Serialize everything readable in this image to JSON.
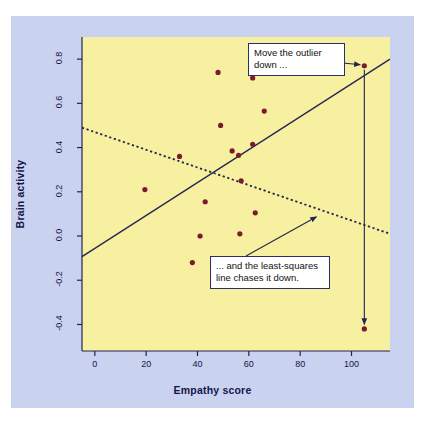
{
  "figure": {
    "background_color": "#ffffff",
    "panel_color": "#c9d2ef",
    "plot_background_color": "#f7f0a0",
    "point_color": "#7b1a2e",
    "line_color": "#23254f",
    "callout_border_color": "#2b2f6b"
  },
  "chart_data": {
    "type": "scatter",
    "title": "",
    "xlabel": "Empathy score",
    "ylabel": "Brain activity",
    "xlim": [
      -5,
      115
    ],
    "ylim": [
      -0.52,
      0.9
    ],
    "xticks": [
      0,
      20,
      40,
      60,
      80,
      100
    ],
    "xticklabels": [
      "0",
      "20",
      "40",
      "60",
      "80",
      "100"
    ],
    "yticks": [
      -0.4,
      -0.2,
      0.0,
      0.2,
      0.4,
      0.6,
      0.8
    ],
    "yticklabels": [
      "-0.4",
      "-0.2",
      "0.0",
      "0.2",
      "0.4",
      "0.6",
      "0.8"
    ],
    "grid": false,
    "legend": null,
    "points": [
      {
        "x": 19.5,
        "y": 0.21
      },
      {
        "x": 33.0,
        "y": 0.36
      },
      {
        "x": 38.0,
        "y": -0.12
      },
      {
        "x": 41.0,
        "y": 0.0
      },
      {
        "x": 43.0,
        "y": 0.155
      },
      {
        "x": 48.0,
        "y": 0.74
      },
      {
        "x": 49.0,
        "y": 0.5
      },
      {
        "x": 53.5,
        "y": 0.385
      },
      {
        "x": 56.0,
        "y": 0.365
      },
      {
        "x": 56.5,
        "y": 0.01
      },
      {
        "x": 57.0,
        "y": 0.25
      },
      {
        "x": 61.5,
        "y": 0.415
      },
      {
        "x": 61.5,
        "y": 0.715
      },
      {
        "x": 62.5,
        "y": 0.105
      },
      {
        "x": 66.0,
        "y": 0.565
      },
      {
        "x": 105.0,
        "y": 0.77
      },
      {
        "x": 105.0,
        "y": -0.42
      }
    ],
    "lines": [
      {
        "name": "least-squares line with outlier up",
        "style": "solid",
        "x": [
          -5,
          115
        ],
        "y": [
          -0.093,
          0.8
        ]
      },
      {
        "name": "least-squares line after outlier moved down",
        "style": "dotted",
        "x": [
          -5,
          115
        ],
        "y": [
          0.49,
          0.01
        ]
      }
    ],
    "annotations": [
      {
        "id": "move-outlier",
        "text": "Move the outlier down ...",
        "lines": [
          "Move the outlier",
          "down ..."
        ],
        "points_to": {
          "x": 105.0,
          "y": 0.77
        }
      },
      {
        "id": "line-chases",
        "text": "... and the least-squares line chases it down.",
        "lines": [
          "... and the least-squares",
          "line chases it down."
        ],
        "points_to": {
          "x": 86.0,
          "y": 0.105
        }
      }
    ],
    "arrows": [
      {
        "name": "outlier-move-arrow",
        "from": {
          "x": 105.0,
          "y": 0.77
        },
        "to": {
          "x": 105.0,
          "y": -0.4
        }
      }
    ]
  }
}
